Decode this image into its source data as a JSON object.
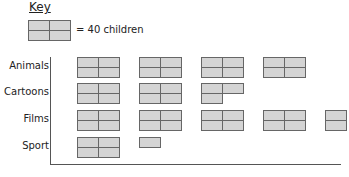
{
  "key": {
    "title": "Key",
    "label": "= 40 children",
    "value_per_icon": 40
  },
  "chart_data": {
    "type": "pictogram",
    "title": "",
    "key": "1 icon = 40 children (each quarter = 10 children)",
    "categories": [
      "Animals",
      "Cartoons",
      "Films",
      "Sport"
    ],
    "values": [
      160,
      110,
      180,
      50
    ],
    "icons": [
      {
        "category": "Animals",
        "full": 4,
        "partial_quarters": []
      },
      {
        "category": "Cartoons",
        "full": 2,
        "partial_quarters": [
          "tl",
          "tr",
          "bl"
        ]
      },
      {
        "category": "Films",
        "full": 4,
        "partial_quarters": [
          "tl",
          "bl"
        ]
      },
      {
        "category": "Sport",
        "full": 1,
        "partial_quarters": [
          "tl"
        ]
      }
    ],
    "xlabel": "",
    "ylabel": ""
  },
  "colors": {
    "fill": "#d4d4d4",
    "stroke": "#666666"
  }
}
